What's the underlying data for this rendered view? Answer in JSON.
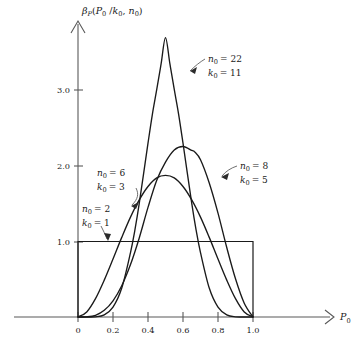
{
  "figure": {
    "background_color": "#ffffff",
    "axis_color": "#595959",
    "curve_color": "#1a1a1a"
  },
  "axes": {
    "y_axis_title_parts": {
      "beta": "β",
      "beta_sub": "P",
      "open": "(",
      "p": "P",
      "p_sub": "0",
      "slash": " /",
      "k": "k",
      "k_sub": "0",
      "comma": ", ",
      "n": "n",
      "n_sub": "0",
      "close": ")"
    },
    "y_axis_title_text": "βₚ(P₀ /k₀, n₀)",
    "x_axis_title_main": "P",
    "x_axis_title_sub": "0",
    "x_tick_labels": [
      "0",
      "0.2",
      "0.4",
      "0.6",
      "0.8",
      "1.0"
    ],
    "y_tick_labels": [
      "1.0",
      "2.0",
      "3.0"
    ]
  },
  "annotations": [
    {
      "id": "n22k11",
      "line1_var": "n",
      "line1_sub": "0",
      "line1_val": "= 22",
      "line2_var": "k",
      "line2_sub": "0",
      "line2_val": "= 11",
      "text": "n₀ = 22, k₀ = 11"
    },
    {
      "id": "n8k5",
      "line1_var": "n",
      "line1_sub": "0",
      "line1_val": "= 8",
      "line2_var": "k",
      "line2_sub": "0",
      "line2_val": "= 5",
      "text": "n₀ = 8, k₀ = 5"
    },
    {
      "id": "n6k3",
      "line1_var": "n",
      "line1_sub": "0",
      "line1_val": "= 6",
      "line2_var": "k",
      "line2_sub": "0",
      "line2_val": "= 3",
      "text": "n₀ = 6, k₀ = 3"
    },
    {
      "id": "n2k1",
      "line1_var": "n",
      "line1_sub": "0",
      "line1_val": "= 2",
      "line2_var": "k",
      "line2_sub": "0",
      "line2_val": "= 1",
      "text": "n₀ = 2, k₀ = 1"
    }
  ],
  "chart_data": {
    "type": "line",
    "title": "",
    "subtitle": "",
    "xlabel": "P₀",
    "ylabel": "βₚ(P₀ /k₀, n₀)",
    "xlim": [
      -0.18,
      1.45
    ],
    "ylim": [
      0,
      4.05
    ],
    "xticks": [
      0,
      0.2,
      0.4,
      0.6,
      0.8,
      1.0
    ],
    "xticklabels": [
      "0",
      "0.2",
      "0.4",
      "0.6",
      "0.8",
      "1.0"
    ],
    "yticks": [
      1.0,
      2.0,
      3.0
    ],
    "yticklabels": [
      "1.0",
      "2.0",
      "3.0"
    ],
    "grid": false,
    "legend": "inline-annotations",
    "series": [
      {
        "name": "n₀ = 2, k₀ = 1",
        "label_n0": 2,
        "label_k0": 1,
        "distribution": "Beta(a=1, b=1) uniform",
        "peak_x": null,
        "peak_y": 1.0,
        "x": [
          0.0,
          0.0,
          1.0,
          1.0
        ],
        "y": [
          0.0,
          1.0,
          1.0,
          0.0
        ]
      },
      {
        "name": "n₀ = 6, k₀ = 3",
        "label_n0": 6,
        "label_k0": 3,
        "distribution": "Beta(a=3, b=3)",
        "peak_x": 0.5,
        "peak_y": 1.875,
        "x": [
          0.0,
          0.05,
          0.1,
          0.15,
          0.2,
          0.25,
          0.3,
          0.35,
          0.4,
          0.45,
          0.5,
          0.55,
          0.6,
          0.65,
          0.7,
          0.75,
          0.8,
          0.85,
          0.9,
          0.95,
          1.0
        ],
        "y": [
          0.0,
          0.0669,
          0.243,
          0.4886,
          0.768,
          1.0547,
          1.323,
          1.5502,
          1.728,
          1.842,
          1.875,
          1.842,
          1.728,
          1.5502,
          1.323,
          1.0547,
          0.768,
          0.4886,
          0.243,
          0.0669,
          0.0
        ]
      },
      {
        "name": "n₀ = 8, k₀ = 5",
        "label_n0": 8,
        "label_k0": 5,
        "distribution": "Beta(a=5, b=3)",
        "peak_x": 0.6667,
        "peak_y": 2.2738,
        "x": [
          0.0,
          0.05,
          0.1,
          0.15,
          0.2,
          0.25,
          0.3,
          0.35,
          0.4,
          0.45,
          0.5,
          0.55,
          0.6,
          0.65,
          0.6667,
          0.7,
          0.75,
          0.8,
          0.85,
          0.9,
          0.95,
          1.0
        ],
        "y": [
          0.0,
          0.0019,
          0.0227,
          0.0886,
          0.215,
          0.415,
          0.6945,
          1.047,
          1.4515,
          1.8115,
          2.051,
          2.2114,
          2.2579,
          2.206,
          2.187,
          2.0825,
          1.775,
          1.376,
          0.9206,
          0.5062,
          0.1831,
          0.0
        ]
      },
      {
        "name": "n₀ = 22, k₀ = 11",
        "label_n0": 22,
        "label_k0": 11,
        "distribution": "Beta(a=11, b=11)",
        "peak_x": 0.5,
        "peak_y": 3.7,
        "x": [
          0.0,
          0.1,
          0.15,
          0.2,
          0.25,
          0.3,
          0.325,
          0.35,
          0.4,
          0.425,
          0.45,
          0.475,
          0.5,
          0.525,
          0.55,
          0.575,
          0.6,
          0.65,
          0.675,
          0.7,
          0.75,
          0.8,
          0.85,
          0.9,
          1.0
        ],
        "y": [
          0.0,
          0.0026,
          0.0271,
          0.1307,
          0.383,
          0.853,
          1.15,
          1.504,
          2.302,
          2.685,
          3.014,
          3.355,
          3.7,
          3.355,
          3.014,
          2.685,
          2.302,
          1.504,
          1.15,
          0.853,
          0.383,
          0.1307,
          0.0271,
          0.0026,
          0.0
        ]
      }
    ]
  }
}
